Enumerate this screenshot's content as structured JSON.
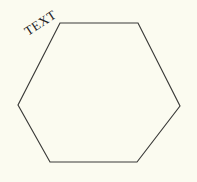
{
  "canvas": {
    "width": 197,
    "height": 182,
    "background_color": "#fbfbf0"
  },
  "figure": {
    "shape_name": "hexagon",
    "stroke_color": "#3a3a38",
    "stroke_width": 1.15,
    "fill": "none",
    "points": "60,23 138,23 180,106 137,162 50,162 18,105",
    "vertices": [
      {
        "label": "top-left",
        "x": 60,
        "y": 23
      },
      {
        "label": "top-right",
        "x": 138,
        "y": 23
      },
      {
        "label": "right",
        "x": 180,
        "y": 106
      },
      {
        "label": "bottom-right",
        "x": 137,
        "y": 162
      },
      {
        "label": "bottom-left",
        "x": 50,
        "y": 162
      },
      {
        "label": "left",
        "x": 18,
        "y": 105
      }
    ],
    "label": {
      "text": "TEXT",
      "color": "#22201e",
      "font_size_px": 13,
      "rotation_deg": -33,
      "anchor_x": 28,
      "anchor_y": 36
    }
  }
}
